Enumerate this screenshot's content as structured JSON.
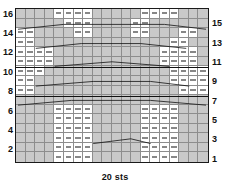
{
  "chart_data": {
    "type": "table",
    "title": "",
    "caption": "20 sts",
    "columns": 20,
    "rows": 16,
    "xlabel": "20 sts",
    "ylabel": "",
    "legend": [],
    "grid": true,
    "row_numbers_left": [
      "16",
      "14",
      "12",
      "10",
      "8",
      "6",
      "4",
      "2"
    ],
    "row_numbers_right": [
      "15",
      "13",
      "11",
      "9",
      "7",
      "5",
      "3",
      "1"
    ],
    "symbols": {
      "purl": "—",
      "knit": "",
      "shaded": "knit-on-RS",
      "cable": "travelling-stitch-line"
    },
    "cells": {
      "row16": [
        "k",
        "k",
        "k",
        "k",
        "p",
        "p",
        "p",
        "p",
        "k",
        "k",
        "k",
        "k",
        "k",
        "p",
        "p",
        "p",
        "p",
        "k",
        "k",
        "k"
      ],
      "row15": [
        "c",
        "c",
        "c",
        "c",
        "c",
        "p",
        "p",
        "p",
        "k",
        "k",
        "k",
        "k",
        "p",
        "p",
        "c",
        "c",
        "c",
        "c",
        "c",
        "c"
      ],
      "row14": [
        "p",
        "p",
        "k",
        "k",
        "k",
        "k",
        "p",
        "p",
        "k",
        "k",
        "k",
        "k",
        "p",
        "p",
        "k",
        "k",
        "k",
        "p",
        "p",
        "k"
      ],
      "row13": [
        "p",
        "p",
        "c",
        "c",
        "c",
        "c",
        "c",
        "c",
        "k",
        "k",
        "c",
        "c",
        "c",
        "c",
        "c",
        "c",
        "p",
        "p",
        "k",
        "k"
      ],
      "row12": [
        "p",
        "p",
        "p",
        "p",
        "k",
        "k",
        "k",
        "k",
        "k",
        "k",
        "k",
        "k",
        "k",
        "k",
        "k",
        "p",
        "p",
        "p",
        "p",
        "k"
      ],
      "row11": [
        "p",
        "p",
        "p",
        "p",
        "c",
        "c",
        "c",
        "c",
        "c",
        "c",
        "c",
        "c",
        "c",
        "c",
        "c",
        "p",
        "p",
        "p",
        "p",
        "k"
      ],
      "row10": [
        "p",
        "p",
        "p",
        "k",
        "k",
        "k",
        "k",
        "k",
        "k",
        "k",
        "k",
        "k",
        "k",
        "k",
        "k",
        "k",
        "p",
        "p",
        "p",
        "p"
      ],
      "row9": [
        "p",
        "p",
        "c",
        "c",
        "c",
        "c",
        "c",
        "c",
        "c",
        "c",
        "c",
        "c",
        "c",
        "c",
        "c",
        "c",
        "p",
        "p",
        "p",
        "p"
      ],
      "row8": [
        "p",
        "p",
        "k",
        "k",
        "k",
        "k",
        "k",
        "k",
        "k",
        "k",
        "k",
        "k",
        "k",
        "k",
        "k",
        "k",
        "k",
        "p",
        "p",
        "p"
      ],
      "row7": [
        "c",
        "c",
        "c",
        "c",
        "c",
        "k",
        "k",
        "k",
        "k",
        "k",
        "k",
        "k",
        "c",
        "c",
        "c",
        "c",
        "c",
        "c",
        "c",
        "c"
      ],
      "row6": [
        "k",
        "k",
        "k",
        "k",
        "p",
        "p",
        "p",
        "p",
        "k",
        "k",
        "k",
        "k",
        "k",
        "p",
        "p",
        "p",
        "p",
        "k",
        "k",
        "k"
      ],
      "row5": [
        "k",
        "k",
        "k",
        "k",
        "p",
        "p",
        "p",
        "p",
        "k",
        "k",
        "k",
        "k",
        "k",
        "p",
        "p",
        "p",
        "p",
        "k",
        "k",
        "k"
      ],
      "row4": [
        "k",
        "k",
        "k",
        "k",
        "p",
        "p",
        "p",
        "p",
        "k",
        "k",
        "k",
        "k",
        "k",
        "p",
        "p",
        "p",
        "p",
        "k",
        "k",
        "k"
      ],
      "row3": [
        "k",
        "k",
        "k",
        "k",
        "p",
        "p",
        "p",
        "p",
        "c",
        "c",
        "c",
        "c",
        "c",
        "p",
        "p",
        "p",
        "p",
        "k",
        "k",
        "k"
      ],
      "row2": [
        "k",
        "k",
        "k",
        "k",
        "p",
        "p",
        "p",
        "p",
        "k",
        "k",
        "k",
        "k",
        "k",
        "p",
        "p",
        "p",
        "p",
        "k",
        "k",
        "k"
      ],
      "row1": [
        "k",
        "k",
        "k",
        "k",
        "p",
        "p",
        "p",
        "p",
        "k",
        "k",
        "k",
        "k",
        "k",
        "p",
        "p",
        "p",
        "p",
        "k",
        "k",
        "k"
      ]
    }
  },
  "caption": {
    "stitch_count": "20 sts"
  },
  "colors": {
    "grid_line": "#8d8d8d",
    "border": "#1a1a1a",
    "shade": "#c9c9c9",
    "symbol": "#111111",
    "background": "#ffffff"
  }
}
